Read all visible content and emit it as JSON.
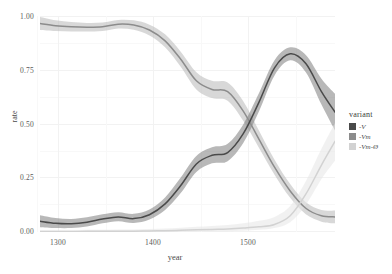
{
  "chart_data": {
    "type": "line",
    "title": "",
    "xlabel": "year",
    "ylabel": "rate",
    "xlim": [
      1270,
      1553
    ],
    "ylim": [
      0.0,
      1.0
    ],
    "grid": true,
    "legend_position": "right",
    "legend_title": "variant",
    "x_ticks": [
      "1300",
      "1400",
      "1500"
    ],
    "x_tick_values": [
      1300,
      1400,
      1500
    ],
    "y_ticks": [
      "0.00",
      "0.25",
      "0.50",
      "0.75",
      "1.00"
    ],
    "y_tick_values": [
      0.0,
      0.25,
      0.5,
      0.75,
      1.0
    ],
    "x": [
      1270,
      1285,
      1300,
      1315,
      1330,
      1345,
      1360,
      1375,
      1390,
      1405,
      1420,
      1435,
      1450,
      1465,
      1480,
      1495,
      1510,
      1525,
      1540,
      1553
    ],
    "series": [
      {
        "name": "-V",
        "color": "#8c8c8c",
        "ribbon_color": "#b8b8b8",
        "values": [
          0.965,
          0.955,
          0.95,
          0.948,
          0.95,
          0.962,
          0.958,
          0.935,
          0.885,
          0.8,
          0.7,
          0.66,
          0.65,
          0.56,
          0.43,
          0.3,
          0.19,
          0.11,
          0.075,
          0.07
        ],
        "ci_lower": [
          0.935,
          0.93,
          0.928,
          0.928,
          0.93,
          0.942,
          0.936,
          0.91,
          0.855,
          0.765,
          0.66,
          0.62,
          0.608,
          0.515,
          0.39,
          0.265,
          0.158,
          0.082,
          0.048,
          0.04
        ],
        "ci_upper": [
          0.995,
          0.98,
          0.972,
          0.968,
          0.97,
          0.982,
          0.98,
          0.96,
          0.915,
          0.835,
          0.74,
          0.7,
          0.692,
          0.605,
          0.47,
          0.335,
          0.222,
          0.138,
          0.102,
          0.1
        ]
      },
      {
        "name": "-Vm",
        "color": "#4a4a4a",
        "ribbon_color": "#7d7d7d",
        "values": [
          0.05,
          0.04,
          0.038,
          0.045,
          0.06,
          0.07,
          0.062,
          0.08,
          0.13,
          0.215,
          0.315,
          0.355,
          0.368,
          0.455,
          0.6,
          0.76,
          0.825,
          0.78,
          0.65,
          0.555
        ],
        "ci_lower": [
          0.022,
          0.018,
          0.018,
          0.025,
          0.04,
          0.05,
          0.042,
          0.058,
          0.102,
          0.18,
          0.278,
          0.318,
          0.328,
          0.412,
          0.558,
          0.725,
          0.795,
          0.74,
          0.59,
          0.47
        ],
        "ci_upper": [
          0.078,
          0.065,
          0.06,
          0.068,
          0.082,
          0.092,
          0.084,
          0.104,
          0.16,
          0.252,
          0.352,
          0.392,
          0.408,
          0.498,
          0.642,
          0.795,
          0.855,
          0.82,
          0.71,
          0.64
        ]
      },
      {
        "name": "-Vm-Ø",
        "color": "#d2d2d2",
        "ribbon_color": "#e6e6e6",
        "values": [
          0.002,
          0.002,
          0.002,
          0.003,
          0.003,
          0.004,
          0.004,
          0.005,
          0.006,
          0.008,
          0.01,
          0.012,
          0.014,
          0.018,
          0.024,
          0.035,
          0.075,
          0.175,
          0.31,
          0.42
        ],
        "ci_lower": [
          0.0,
          0.0,
          0.0,
          0.0,
          0.0,
          0.0,
          0.0,
          0.0,
          0.0,
          0.001,
          0.002,
          0.003,
          0.004,
          0.006,
          0.01,
          0.018,
          0.045,
          0.125,
          0.245,
          0.33
        ],
        "ci_upper": [
          0.008,
          0.008,
          0.008,
          0.01,
          0.01,
          0.012,
          0.012,
          0.014,
          0.016,
          0.02,
          0.024,
          0.028,
          0.032,
          0.04,
          0.052,
          0.07,
          0.12,
          0.235,
          0.385,
          0.505
        ]
      }
    ]
  },
  "legend": {
    "title": "variant",
    "items": [
      {
        "label": "-V"
      },
      {
        "label": "-Vm"
      },
      {
        "label": "-Vm-Ø"
      }
    ]
  },
  "axes": {
    "x_label": "year",
    "y_label": "rate"
  }
}
